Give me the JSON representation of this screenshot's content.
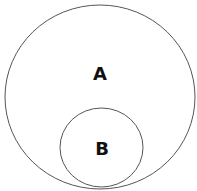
{
  "diagram": {
    "type": "venn-subset",
    "sets": [
      {
        "id": "A",
        "label": "A",
        "role": "outer",
        "cx": 100,
        "cy": 97,
        "rx": 95,
        "ry": 92,
        "stroke": "#555555"
      },
      {
        "id": "B",
        "label": "B",
        "role": "inner",
        "cx": 101.5,
        "cy": 147.5,
        "rx": 41.5,
        "ry": 39.5,
        "stroke": "#555555"
      }
    ],
    "relation": "B is a subset of A"
  }
}
